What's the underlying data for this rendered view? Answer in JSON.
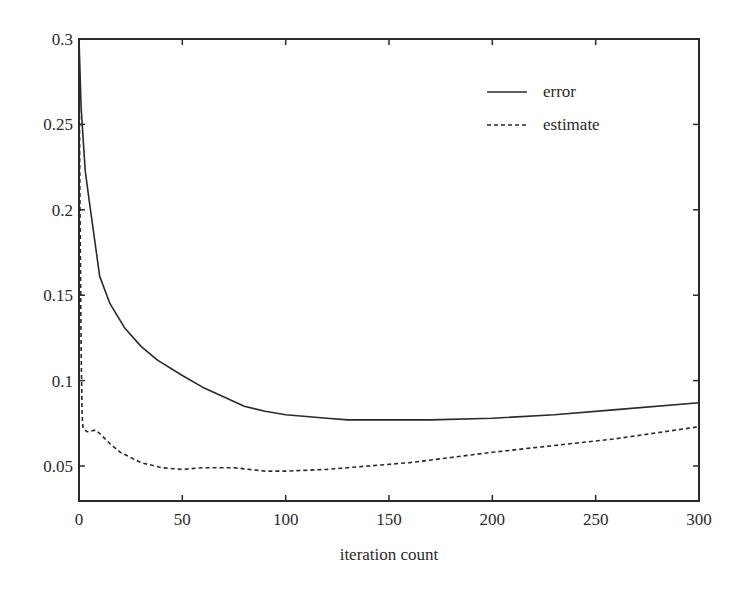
{
  "chart_data": {
    "type": "line",
    "title": "",
    "xlabel": "iteration count",
    "ylabel": "",
    "xlim": [
      0,
      300
    ],
    "ylim": [
      0.03,
      0.3
    ],
    "grid": false,
    "legend_position": "upper right (inside)",
    "x_ticks": [
      0,
      50,
      100,
      150,
      200,
      250,
      300
    ],
    "x_tick_labels": [
      "0",
      "50",
      "100",
      "150",
      "200",
      "250",
      "300"
    ],
    "y_ticks": [
      0.05,
      0.1,
      0.15,
      0.2,
      0.25,
      0.3
    ],
    "y_tick_labels": [
      "0.05",
      "0.1",
      "0.15",
      "0.2",
      "0.25",
      "0.3"
    ],
    "series": [
      {
        "name": "error",
        "style": "solid",
        "x": [
          0,
          1,
          3,
          5,
          10,
          15,
          22,
          30,
          38,
          50,
          60,
          71,
          80,
          90,
          100,
          120,
          130,
          150,
          170,
          200,
          230,
          260,
          300
        ],
        "values": [
          0.3,
          0.26,
          0.223,
          0.205,
          0.161,
          0.145,
          0.131,
          0.12,
          0.112,
          0.103,
          0.096,
          0.09,
          0.085,
          0.082,
          0.08,
          0.078,
          0.077,
          0.077,
          0.077,
          0.078,
          0.08,
          0.083,
          0.087
        ]
      },
      {
        "name": "estimate",
        "style": "dashed",
        "x": [
          0,
          0.5,
          1,
          1.5,
          2,
          4,
          8,
          10,
          15,
          20,
          30,
          40,
          50,
          60,
          75,
          90,
          100,
          120,
          140,
          160,
          180,
          200,
          230,
          260,
          300
        ],
        "values": [
          0.3,
          0.2,
          0.12,
          0.08,
          0.072,
          0.07,
          0.071,
          0.069,
          0.063,
          0.058,
          0.052,
          0.049,
          0.048,
          0.049,
          0.049,
          0.047,
          0.047,
          0.048,
          0.05,
          0.052,
          0.055,
          0.058,
          0.062,
          0.066,
          0.073
        ]
      }
    ]
  },
  "legend": {
    "items": [
      {
        "label": "error",
        "style": "solid"
      },
      {
        "label": "estimate",
        "style": "dashed"
      }
    ]
  },
  "colors": {
    "line": "#2a2a2a",
    "axes": "#2a2a2a",
    "background": "#ffffff"
  }
}
